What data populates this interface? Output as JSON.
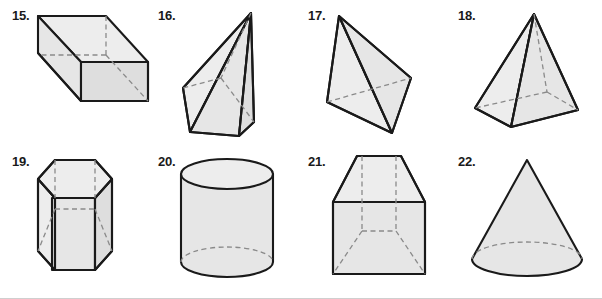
{
  "sheet": {
    "title": "Geometric solids identification exercise",
    "background_color": "#ffffff",
    "fill_color": "#e6e6e6",
    "edge_color": "#1a1a1a",
    "hidden_edge_color": "#8a8a8a",
    "rule_color": "#cfcfcf",
    "rows": 2,
    "columns": 4
  },
  "figures": [
    {
      "number": "15.",
      "shape": "rectangular prism",
      "row": 1,
      "column": 1,
      "has_hidden_edges": true
    },
    {
      "number": "16.",
      "shape": "oblique quadrilateral pyramid",
      "row": 1,
      "column": 2,
      "has_hidden_edges": true
    },
    {
      "number": "17.",
      "shape": "triangular pyramid",
      "row": 1,
      "column": 3,
      "has_hidden_edges": true
    },
    {
      "number": "18.",
      "shape": "square pyramid",
      "row": 1,
      "column": 4,
      "has_hidden_edges": true
    },
    {
      "number": "19.",
      "shape": "hexagonal prism",
      "row": 2,
      "column": 1,
      "has_hidden_edges": true
    },
    {
      "number": "20.",
      "shape": "cylinder",
      "row": 2,
      "column": 2,
      "has_hidden_edges": true
    },
    {
      "number": "21.",
      "shape": "trapezoidal prism",
      "row": 2,
      "column": 3,
      "has_hidden_edges": true
    },
    {
      "number": "22.",
      "shape": "cone",
      "row": 2,
      "column": 4,
      "has_hidden_edges": true
    }
  ]
}
